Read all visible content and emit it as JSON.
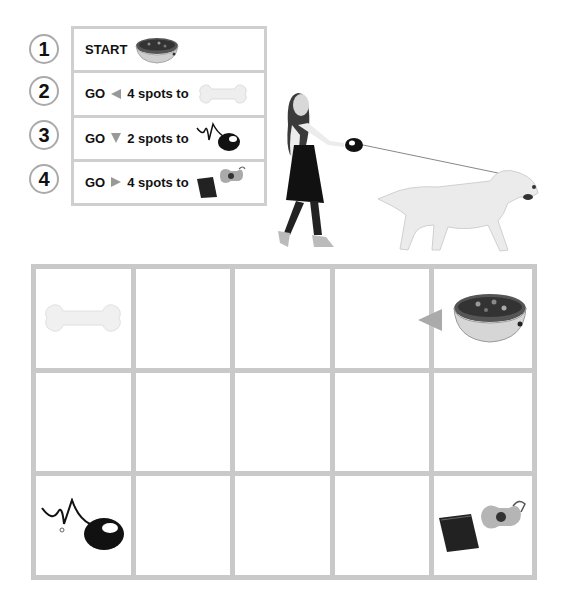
{
  "steps": [
    {
      "number": "1",
      "verb": "START",
      "direction": "",
      "count": "",
      "target": "food-bowl"
    },
    {
      "number": "2",
      "verb": "GO",
      "direction": "left",
      "count": "4 spots to",
      "target": "bone"
    },
    {
      "number": "3",
      "verb": "GO",
      "direction": "down",
      "count": "2 spots to",
      "target": "leash"
    },
    {
      "number": "4",
      "verb": "GO",
      "direction": "right",
      "count": "4 spots to",
      "target": "waste-bags"
    }
  ],
  "grid": {
    "rows": 3,
    "columns": 5,
    "items": [
      {
        "row": 1,
        "col": 1,
        "item": "bone"
      },
      {
        "row": 1,
        "col": 5,
        "item": "food-bowl",
        "arrow": "left"
      },
      {
        "row": 3,
        "col": 1,
        "item": "leash"
      },
      {
        "row": 3,
        "col": 5,
        "item": "waste-bags"
      }
    ]
  },
  "illustration": "girl walking dog on leash",
  "colors": {
    "grid_line": "#c9c9c9",
    "arrow": "#999999",
    "circle_border": "#aaaaaa"
  }
}
